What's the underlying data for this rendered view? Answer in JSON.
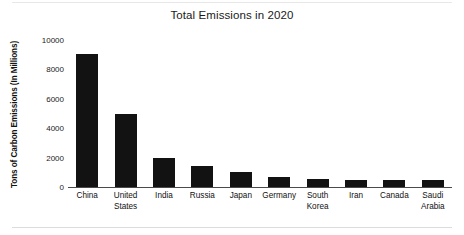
{
  "chart_data": {
    "type": "bar",
    "title": "Total Emissions in 2020",
    "xlabel": "",
    "ylabel": "Tons of Carbon Emissions (In Millions)",
    "categories": [
      "China",
      "United States",
      "India",
      "Russia",
      "Japan",
      "Germany",
      "South Korea",
      "Iran",
      "Canada",
      "Saudi Arabia"
    ],
    "category_lines": [
      [
        "China"
      ],
      [
        "United",
        "States"
      ],
      [
        "India"
      ],
      [
        "Russia"
      ],
      [
        "Japan"
      ],
      [
        "Germany"
      ],
      [
        "South",
        "Korea"
      ],
      [
        "Iran"
      ],
      [
        "Canada"
      ],
      [
        "Saudi",
        "Arabia"
      ]
    ],
    "values": [
      9050,
      4950,
      2000,
      1400,
      1050,
      650,
      550,
      500,
      500,
      480
    ],
    "ylim": [
      0,
      10000
    ],
    "ytick_labels": [
      "0",
      "2000",
      "4000",
      "6000",
      "8000",
      "10000"
    ],
    "ytick_values": [
      0,
      2000,
      4000,
      6000,
      8000,
      10000
    ],
    "grid": false,
    "legend": "none",
    "bar_color": "#121212",
    "background_color": "#ffffff",
    "axis_color": "#4a4a4a",
    "text_color": "#111111"
  }
}
